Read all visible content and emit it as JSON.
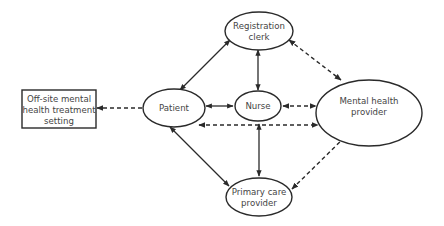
{
  "diagram": {
    "colors": {
      "stroke": "#2a2a2a",
      "text": "#444444",
      "background": "#ffffff"
    },
    "nodes": {
      "offsite": {
        "shape": "rectangle",
        "lines": [
          "Off-site mental",
          "health treatment",
          "setting"
        ]
      },
      "patient": {
        "shape": "ellipse",
        "lines": [
          "Patient"
        ]
      },
      "nurse": {
        "shape": "ellipse",
        "lines": [
          "Nurse"
        ]
      },
      "registration": {
        "shape": "ellipse",
        "lines": [
          "Registration",
          "clerk"
        ]
      },
      "mental_health": {
        "shape": "ellipse",
        "lines": [
          "Mental health",
          "provider"
        ]
      },
      "primary_care": {
        "shape": "ellipse",
        "lines": [
          "Primary care",
          "provider"
        ]
      }
    },
    "edges": [
      {
        "from": "Patient",
        "to": "Registration clerk",
        "style": "solid",
        "direction": "both"
      },
      {
        "from": "Patient",
        "to": "Nurse",
        "style": "solid",
        "direction": "both"
      },
      {
        "from": "Patient",
        "to": "Primary care provider",
        "style": "solid",
        "direction": "both"
      },
      {
        "from": "Registration clerk",
        "to": "Nurse",
        "style": "solid",
        "direction": "both"
      },
      {
        "from": "Nurse",
        "to": "Primary care provider",
        "style": "solid",
        "direction": "both"
      },
      {
        "from": "Nurse",
        "to": "Mental health provider",
        "style": "dashed",
        "direction": "both"
      },
      {
        "from": "Patient",
        "to": "Mental health provider",
        "style": "dashed",
        "direction": "both"
      },
      {
        "from": "Registration clerk",
        "to": "Mental health provider",
        "style": "dashed",
        "direction": "both"
      },
      {
        "from": "Primary care provider",
        "to": "Mental health provider",
        "style": "dashed",
        "direction": "both"
      },
      {
        "from": "Patient",
        "to": "Off-site mental health treatment setting",
        "style": "dashed",
        "direction": "forward"
      }
    ]
  }
}
